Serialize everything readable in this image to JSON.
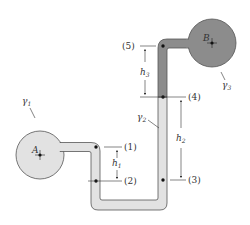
{
  "diagram": {
    "type": "inclined manometer / pressure measurement",
    "vessels": {
      "A": {
        "label": "A",
        "fluid_label": "γ",
        "fluid_sub": "1",
        "fill": "#e2e2e2"
      },
      "B": {
        "label": "B",
        "fluid_label": "γ",
        "fluid_sub": "3",
        "fill": "#8c8c8c"
      }
    },
    "tube_fluid": {
      "label": "γ",
      "sub": "2"
    },
    "points": [
      {
        "id": "1",
        "label": "(1)"
      },
      {
        "id": "2",
        "label": "(2)"
      },
      {
        "id": "3",
        "label": "(3)"
      },
      {
        "id": "4",
        "label": "(4)"
      },
      {
        "id": "5",
        "label": "(5)"
      }
    ],
    "heights": [
      {
        "label": "h",
        "sub": "1"
      },
      {
        "label": "h",
        "sub": "2"
      },
      {
        "label": "h",
        "sub": "3"
      }
    ],
    "colors": {
      "light_fluid": "#e2e2e2",
      "dark_fluid": "#8c8c8c",
      "outline": "#555555"
    }
  }
}
